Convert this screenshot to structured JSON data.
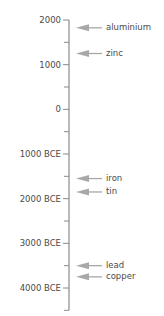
{
  "chart_data": {
    "type": "timeline",
    "title": "",
    "axis": {
      "orientation": "vertical",
      "direction": "top = most recent",
      "range": [
        -4500,
        2000
      ],
      "ticks": [
        {
          "value": 2000,
          "label": "2000"
        },
        {
          "value": 1000,
          "label": "1000"
        },
        {
          "value": 0,
          "label": "0"
        },
        {
          "value": -1000,
          "label": "1000 BCE"
        },
        {
          "value": -2000,
          "label": "2000 BCE"
        },
        {
          "value": -3000,
          "label": "3000 BCE"
        },
        {
          "value": -4000,
          "label": "4000 BCE"
        }
      ],
      "minor_tick_interval": 500
    },
    "events": [
      {
        "label": "aluminium",
        "year": 1825
      },
      {
        "label": "zinc",
        "year": 1250
      },
      {
        "label": "iron",
        "year": -1550
      },
      {
        "label": "tin",
        "year": -1850
      },
      {
        "label": "lead",
        "year": -3500
      },
      {
        "label": "copper",
        "year": -3750
      }
    ]
  },
  "colors": {
    "axis": "#8a8a8a",
    "arrow": "#a8a8a8",
    "text": "#4a4a4a"
  }
}
